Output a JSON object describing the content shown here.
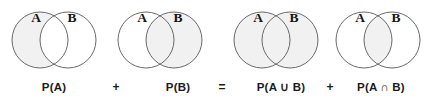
{
  "figure": {
    "equation_text": "P(A) + P(B) = P(A ∪ B) + P(A ∩ B)",
    "background_color": "#ffffff",
    "shade_color": "#f1f1f1",
    "stroke_color": "#595959",
    "text_color": "#1a1a1a"
  },
  "diagrams": [
    {
      "id": "diagram-p-a",
      "set_a_label": "A",
      "set_b_label": "B",
      "shaded_region": "A",
      "caption": "P(A)"
    },
    {
      "id": "diagram-p-b",
      "set_a_label": "A",
      "set_b_label": "B",
      "shaded_region": "B",
      "caption": "P(B)"
    },
    {
      "id": "diagram-p-a-union-b",
      "set_a_label": "A",
      "set_b_label": "B",
      "shaded_region": "A union B",
      "caption": "P(A ∪ B)"
    },
    {
      "id": "diagram-p-a-intersect-b",
      "set_a_label": "A",
      "set_b_label": "B",
      "shaded_region": "A intersect B",
      "caption": "P(A ∩ B)"
    }
  ],
  "operators": {
    "plus_first": "+",
    "equals": "=",
    "plus_second": "+"
  }
}
